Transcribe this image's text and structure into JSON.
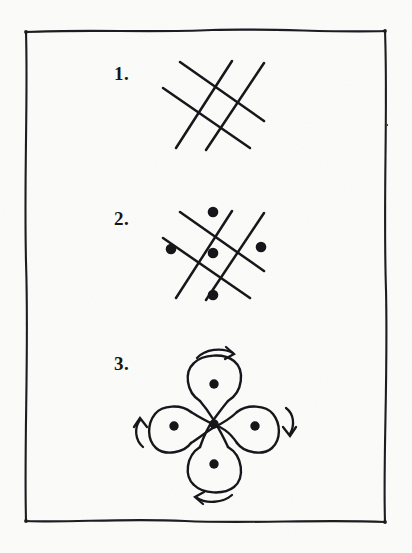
{
  "page": {
    "background_color": "#fbfbfa",
    "ink_color": "#16161a",
    "width": 412,
    "height": 553,
    "medium": "hand-drawn pen on paper"
  },
  "border": {
    "name": "hand-drawn rectangle frame",
    "stroke_color": "#1d1d20",
    "stroke_width": 2.1,
    "left": 25,
    "top": 31,
    "right": 386,
    "bottom": 522
  },
  "steps": [
    {
      "number": "1.",
      "label_x": 114,
      "label_y": 63,
      "caption": "Draw the crossing diagonal lattice",
      "figure": {
        "type": "lattice",
        "center_x": 213,
        "center_y": 103,
        "cell": 27,
        "overhang": 17,
        "dots": [],
        "arrows": []
      }
    },
    {
      "number": "2.",
      "label_x": 114,
      "label_y": 208,
      "caption": "Add the five dots in a quincunx",
      "figure": {
        "type": "lattice-with-dots",
        "center_x": 213,
        "center_y": 253,
        "cell": 27,
        "overhang": 17,
        "dot_radius": 5.2,
        "dots": [
          {
            "name": "center-dot",
            "dx": 0,
            "dy": 0
          },
          {
            "name": "top-dot",
            "dx": 0,
            "dy": -41
          },
          {
            "name": "bottom-dot",
            "dx": 0,
            "dy": 41
          },
          {
            "name": "left-dot",
            "dx": -53,
            "dy": 0
          },
          {
            "name": "right-dot",
            "dx": 53,
            "dy": 0
          }
        ],
        "arrows": []
      }
    },
    {
      "number": "3.",
      "label_x": 114,
      "label_y": 353,
      "caption": "Loop the lines around the outer dots",
      "figure": {
        "type": "kolam-loops",
        "center_x": 213,
        "center_y": 424,
        "cell": 27,
        "dot_radius": 4.6,
        "petal_count": 4,
        "dots": [
          {
            "name": "center-dot",
            "dx": 0,
            "dy": 0
          },
          {
            "name": "top-dot",
            "dx": 0,
            "dy": -38
          },
          {
            "name": "bottom-dot",
            "dx": 0,
            "dy": 38
          },
          {
            "name": "left-dot",
            "dx": -42,
            "dy": 0
          },
          {
            "name": "right-dot",
            "dx": 42,
            "dy": 0
          }
        ],
        "arrows": [
          {
            "name": "arrow-top",
            "direction": "clockwise-right",
            "position": "above top petal"
          },
          {
            "name": "arrow-right",
            "direction": "clockwise-down",
            "position": "right of right petal"
          },
          {
            "name": "arrow-bottom",
            "direction": "clockwise-left",
            "position": "below bottom petal"
          },
          {
            "name": "arrow-left",
            "direction": "clockwise-up",
            "position": "left of left petal"
          }
        ]
      }
    }
  ]
}
